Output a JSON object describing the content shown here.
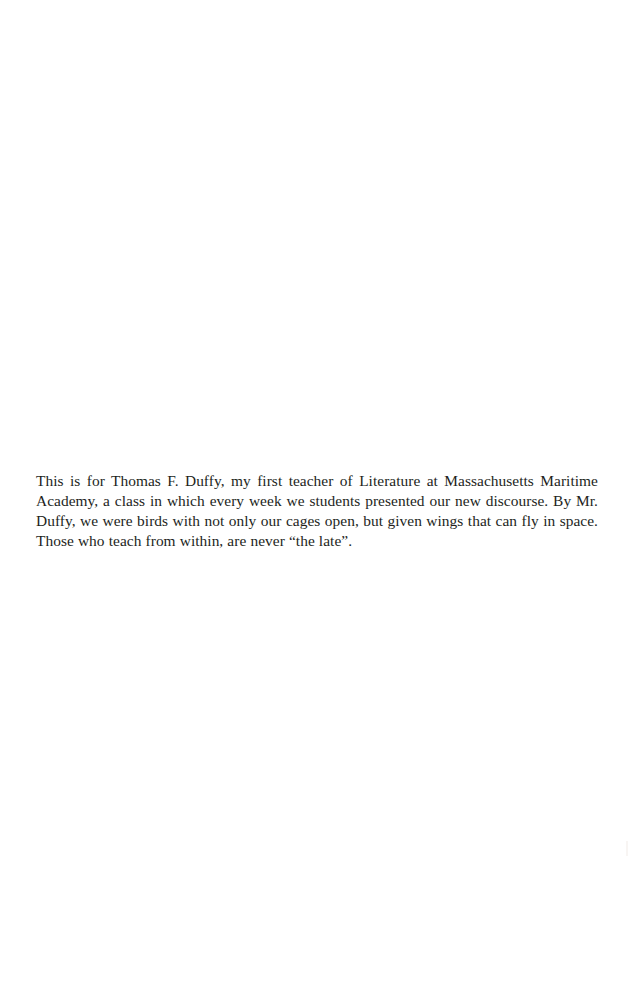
{
  "page": {
    "kind": "book-dedication-page",
    "background_color": "#ffffff",
    "text_color": "#231f1c",
    "width_px": 634,
    "height_px": 999
  },
  "dedication": {
    "text": "This is for Thomas F. Duffy, my first teacher of Literature at Massachusetts Maritime Academy, a class in which every week we students presented our new discourse. By Mr. Duffy, we were birds with not only our cages open, but given wings that can fly in space. Those who teach from within, are never “the late”.",
    "lines": [
      "This is for Thomas F. Duffy, my first teacher of Literature at Massachusetts Maritime",
      "Academy, a class in which every week we students presented our new discourse. By Mr.",
      "Duffy, we were birds with not only our cages open, but given wings that can fly in space.",
      "Those who teach from within, are never “the late”."
    ],
    "alignment": "justified",
    "dedicatee": "Thomas F. Duffy",
    "institution": "Massachusetts Maritime Academy"
  },
  "artifact": {
    "label": "scan-mark"
  }
}
